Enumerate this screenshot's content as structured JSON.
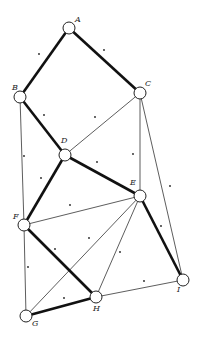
{
  "diagram": {
    "type": "graph",
    "nodes": [
      {
        "id": "A",
        "x": 69,
        "y": 28,
        "label": "A",
        "lx": 75,
        "ly": 22
      },
      {
        "id": "B",
        "x": 20,
        "y": 97,
        "label": "B",
        "lx": 12,
        "ly": 90
      },
      {
        "id": "C",
        "x": 140,
        "y": 93,
        "label": "C",
        "lx": 145,
        "ly": 86
      },
      {
        "id": "D",
        "x": 65,
        "y": 155,
        "label": "D",
        "lx": 61,
        "ly": 143
      },
      {
        "id": "E",
        "x": 140,
        "y": 196,
        "label": "E",
        "lx": 130,
        "ly": 185
      },
      {
        "id": "F",
        "x": 24,
        "y": 225,
        "label": "F",
        "lx": 13,
        "ly": 219
      },
      {
        "id": "G",
        "x": 26,
        "y": 316,
        "label": "G",
        "lx": 32,
        "ly": 326
      },
      {
        "id": "H",
        "x": 96,
        "y": 297,
        "label": "H",
        "lx": 93,
        "ly": 311
      },
      {
        "id": "I",
        "x": 183,
        "y": 280,
        "label": "I",
        "lx": 177,
        "ly": 292
      }
    ],
    "edges": [
      {
        "from": "A",
        "to": "B",
        "weight": "thick"
      },
      {
        "from": "A",
        "to": "C",
        "weight": "thick"
      },
      {
        "from": "B",
        "to": "D",
        "weight": "thick"
      },
      {
        "from": "B",
        "to": "F",
        "weight": "thin"
      },
      {
        "from": "C",
        "to": "D",
        "weight": "thin"
      },
      {
        "from": "C",
        "to": "E",
        "weight": "thin"
      },
      {
        "from": "C",
        "to": "I",
        "weight": "thin"
      },
      {
        "from": "D",
        "to": "E",
        "weight": "thick"
      },
      {
        "from": "D",
        "to": "F",
        "weight": "thick"
      },
      {
        "from": "E",
        "to": "F",
        "weight": "thin"
      },
      {
        "from": "E",
        "to": "G",
        "weight": "thin"
      },
      {
        "from": "E",
        "to": "H",
        "weight": "thin"
      },
      {
        "from": "E",
        "to": "I",
        "weight": "thick"
      },
      {
        "from": "F",
        "to": "G",
        "weight": "thin"
      },
      {
        "from": "F",
        "to": "H",
        "weight": "thick"
      },
      {
        "from": "G",
        "to": "H",
        "weight": "thick"
      },
      {
        "from": "H",
        "to": "I",
        "weight": "thin"
      }
    ],
    "face_dots": [
      [
        39,
        54
      ],
      [
        104,
        50
      ],
      [
        44,
        115
      ],
      [
        95,
        117
      ],
      [
        24,
        156
      ],
      [
        41,
        178
      ],
      [
        97,
        162
      ],
      [
        133,
        154
      ],
      [
        170,
        186
      ],
      [
        70,
        205
      ],
      [
        89,
        238
      ],
      [
        55,
        249
      ],
      [
        28,
        267
      ],
      [
        120,
        252
      ],
      [
        161,
        226
      ],
      [
        64,
        298
      ],
      [
        144,
        281
      ]
    ],
    "node_radius": 6
  }
}
